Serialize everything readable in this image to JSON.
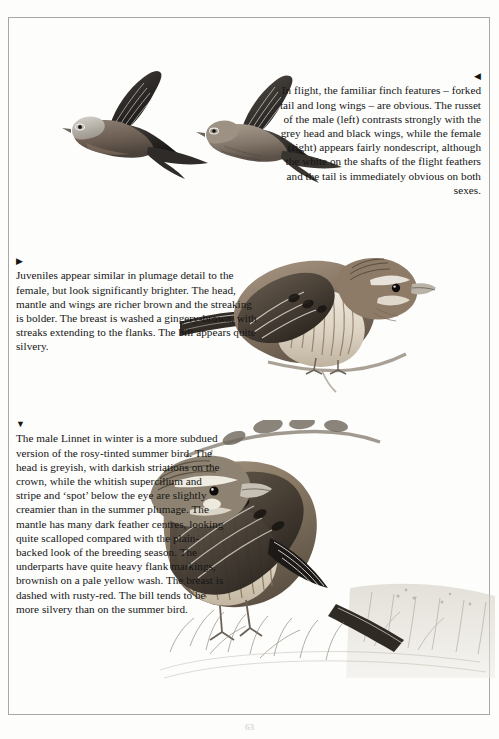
{
  "page": {
    "number": "63",
    "border_color": "#a8a8a8",
    "background_color": "#fdfdfc",
    "text_color": "#151515"
  },
  "captions": [
    {
      "id": "flight",
      "marker": "◀",
      "marker_name": "left-pointing-triangle",
      "align": "right",
      "text": "In flight, the familiar finch features – forked tail and long wings – are obvious. The russet of the male (left) contrasts strongly with the grey head and black wings, while the female (right) appears fairly nondescript, although the white on the shafts of the flight feathers and the tail is immediately obvious on both sexes."
    },
    {
      "id": "juvenile",
      "marker": "▶",
      "marker_name": "right-pointing-triangle",
      "align": "left",
      "text": "Juveniles appear similar in plumage detail to the female, but look significantly brighter. The head, mantle and wings are richer brown and the streaking is bolder. The breast is washed a gingery-brown, with streaks extending to the flanks. The bill appears quite silvery."
    },
    {
      "id": "winter",
      "marker": "▼",
      "marker_name": "down-pointing-triangle",
      "align": "left",
      "text": "The male Linnet in winter is a more subdued version of the rosy-tinted summer bird. The head is greyish, with darkish striations on the crown, while the whitish supercilium and stripe and ‘spot’ below the eye are slightly creamier than in the summer plumage. The mantle has many dark feather centres, looking quite scalloped compared with the plain-backed look of the breeding season. The underparts have quite heavy flank markings, brownish on a pale yellow wash. The breast is dashed with rusty-red. The bill tends to be more silvery than on the summer bird."
    }
  ],
  "illustrations": [
    {
      "id": "flying-male",
      "label": "linnet-in-flight-male",
      "description": "Male Linnet in flight, left of pair, russet body, grey head, black wings"
    },
    {
      "id": "flying-female",
      "label": "linnet-in-flight-female",
      "description": "Female Linnet in flight, right of pair, nondescript brown, white flight feather shafts"
    },
    {
      "id": "perched-juvenile",
      "label": "linnet-juvenile-perched",
      "description": "Juvenile Linnet perched on twig, gingery-brown streaked breast"
    },
    {
      "id": "perched-winter-male",
      "label": "linnet-winter-male-perched",
      "description": "Male Linnet in winter plumage perched on hawthorn branch over grass"
    }
  ]
}
